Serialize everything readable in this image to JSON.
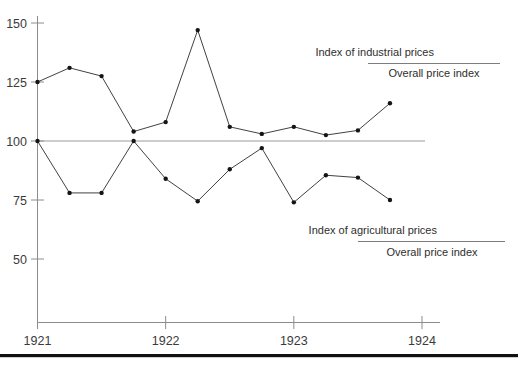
{
  "chart_data": {
    "type": "line",
    "title": "",
    "subtitle": "",
    "xlabel": "",
    "ylabel": "",
    "grid": false,
    "legend_position": "inside-right",
    "x_tick_labels": [
      "1921",
      "1922",
      "1923",
      "1924"
    ],
    "x_tick_values": [
      1921,
      1922,
      1923,
      1924
    ],
    "xlim": [
      1921,
      1924
    ],
    "y_tick_labels": [
      "50",
      "75",
      "100",
      "125",
      "150"
    ],
    "y_tick_values": [
      50,
      75,
      100,
      125,
      150
    ],
    "ylim": [
      30,
      152
    ],
    "reference_line": {
      "value": 100,
      "label": ""
    },
    "x": [
      1921.0,
      1921.25,
      1921.5,
      1921.75,
      1922.0,
      1922.25,
      1922.5,
      1922.75,
      1923.0,
      1923.25,
      1923.5,
      1923.75
    ],
    "series": [
      {
        "name": "Index of industrial prices / Overall price index",
        "numerator": "Index of industrial prices",
        "denominator": "Overall price index",
        "values": [
          125,
          131,
          127.5,
          104,
          108,
          147,
          106,
          103,
          106,
          102.5,
          104.5,
          116
        ]
      },
      {
        "name": "Index of agricultural prices / Overall price index",
        "numerator": "Index of agricultural prices",
        "denominator": "Overall price index",
        "values": [
          100,
          78,
          78,
          100,
          84,
          74.5,
          88,
          97,
          74,
          85.5,
          84.5,
          75
        ]
      }
    ],
    "annotations": [
      {
        "id": "legend-industrial",
        "numerator": "Index of industrial prices",
        "denominator": "Overall price index"
      },
      {
        "id": "legend-agricultural",
        "numerator": "Index of agricultural prices",
        "denominator": "Overall price index"
      }
    ]
  },
  "axis": {
    "y_ticks": [
      {
        "label": "150",
        "value": 150
      },
      {
        "label": "125",
        "value": 125
      },
      {
        "label": "100",
        "value": 100
      },
      {
        "label": "75",
        "value": 75
      },
      {
        "label": "50",
        "value": 50
      }
    ],
    "x_ticks": [
      {
        "label": "1921",
        "value": 1921
      },
      {
        "label": "1922",
        "value": 1922
      },
      {
        "label": "1923",
        "value": 1923
      },
      {
        "label": "1924",
        "value": 1924
      }
    ]
  },
  "legend": {
    "industrial": {
      "numerator": "Index of industrial prices",
      "denominator": "Overall price index"
    },
    "agricultural": {
      "numerator": "Index of agricultural prices",
      "denominator": "Overall price index"
    }
  },
  "colors": {
    "series_line": "#2b2b2b",
    "series_dot": "#141414",
    "axis": "#8c8c8c",
    "reference_line": "#9a9a9a",
    "text": "#2e2e2e",
    "rule": "#111111",
    "background": "#ffffff"
  }
}
